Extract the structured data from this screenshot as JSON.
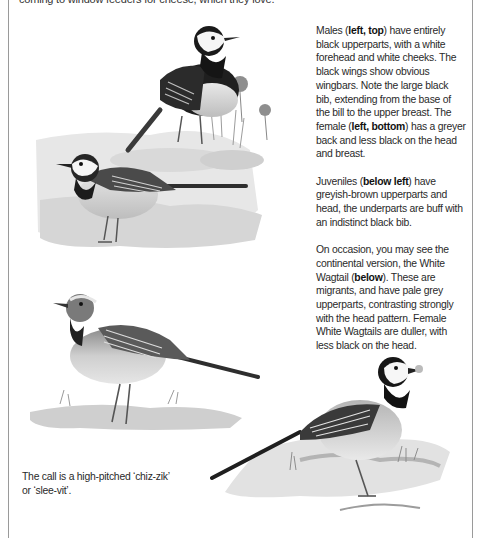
{
  "document": {
    "top_text": "coming to window feeders for cheese, which they love.",
    "paragraphs": [
      [
        {
          "t": "Males ("
        },
        {
          "t": "left, top",
          "b": true
        },
        {
          "t": ") have entirely black upperparts, with a white forehead and white cheeks. The black wings show obvious wingbars. Note the large black bib, extending from the base of the bill to the upper breast. The female ("
        },
        {
          "t": "left, bottom",
          "b": true
        },
        {
          "t": ") has a greyer back and less black on the head and breast."
        }
      ],
      [
        {
          "t": "Juveniles ("
        },
        {
          "t": "below left",
          "b": true
        },
        {
          "t": ") have greyish-brown upperparts and head, the underparts are buff with an indistinct black bib."
        }
      ],
      [
        {
          "t": "On occasion, you may see the continental version, the White Wagtail ("
        },
        {
          "t": "below",
          "b": true
        },
        {
          "t": "). These are migrants, and have pale grey upperparts, contrasting strongly with the head pattern. Female White Wagtails are duller, with less black on the head."
        }
      ]
    ],
    "caption": "The call is a high-pitched ‘chiz-zik’ or ‘slee-vit’."
  },
  "illustrations": [
    {
      "name": "male-pied-wagtail",
      "label": "Male Pied Wagtail (left, top)"
    },
    {
      "name": "female-pied-wagtail",
      "label": "Female Pied Wagtail (left, bottom)"
    },
    {
      "name": "juvenile-wagtail",
      "label": "Juvenile (below left)"
    },
    {
      "name": "white-wagtail",
      "label": "White Wagtail (below)"
    }
  ]
}
